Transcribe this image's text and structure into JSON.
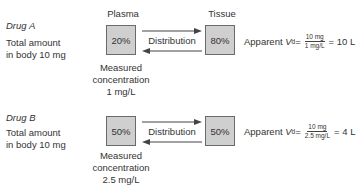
{
  "drugs": [
    {
      "title": "Drug A",
      "desc_line1": "Total amount",
      "desc_line2": "in body 10 mg",
      "plasma_label": "Plasma",
      "tissue_label": "Tissue",
      "plasma_pct": "20%",
      "tissue_pct": "80%",
      "distribution_label": "Distribution",
      "measured_line1": "Measured",
      "measured_line2": "concentration",
      "measured_line3": "1 mg/L",
      "formula_prefix": "Apparent ",
      "formula_v": "V",
      "formula_sub": "d",
      "formula_eq": " = ",
      "frac_num": "10 mg",
      "frac_den": "1 mg/L",
      "formula_result": " = 10 L"
    },
    {
      "title": "Drug B",
      "desc_line1": "Total amount",
      "desc_line2": "in body 10 mg",
      "plasma_pct": "50%",
      "tissue_pct": "50%",
      "distribution_label": "Distribution",
      "measured_line1": "Measured",
      "measured_line2": "concentration",
      "measured_line3": "2.5 mg/L",
      "formula_prefix": "Apparent ",
      "formula_v": "V",
      "formula_sub": "d",
      "formula_eq": " = ",
      "frac_num": "10 mg",
      "frac_den": "2.5 mg/L",
      "formula_result": " = 4 L"
    }
  ]
}
